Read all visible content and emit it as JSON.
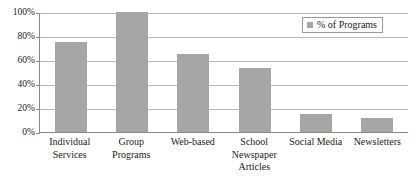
{
  "chart_data": {
    "type": "bar",
    "title": "",
    "xlabel": "",
    "ylabel": "",
    "ylim": [
      0,
      100
    ],
    "grid": true,
    "legend_position": "top-right",
    "categories": [
      "Individual Services",
      "Group Programs",
      "Web-based",
      "School Newspaper Articles",
      "Social Media",
      "Newsletters"
    ],
    "category_lines": [
      [
        "Individual",
        "Services"
      ],
      [
        "Group",
        "Programs"
      ],
      [
        "Web-based"
      ],
      [
        "School",
        "Newspaper",
        "Articles"
      ],
      [
        "Social Media"
      ],
      [
        "Newsletters"
      ]
    ],
    "series": [
      {
        "name": "% of Programs",
        "color": "#a6a6a6",
        "values": [
          75,
          100,
          65,
          53,
          15,
          12
        ]
      }
    ],
    "ytick_labels": [
      "100%",
      "80%",
      "60%",
      "40%",
      "20%",
      "0%"
    ],
    "ytick_values": [
      100,
      80,
      60,
      40,
      20,
      0
    ]
  },
  "legend": {
    "entries": [
      {
        "label": "% of Programs",
        "color": "#a6a6a6"
      }
    ]
  },
  "colors": {
    "bar": "#a6a6a6",
    "gridline": "#b9b9b9",
    "axis": "#8a8a8a",
    "text": "#1a1a1a",
    "background": "#ffffff"
  }
}
